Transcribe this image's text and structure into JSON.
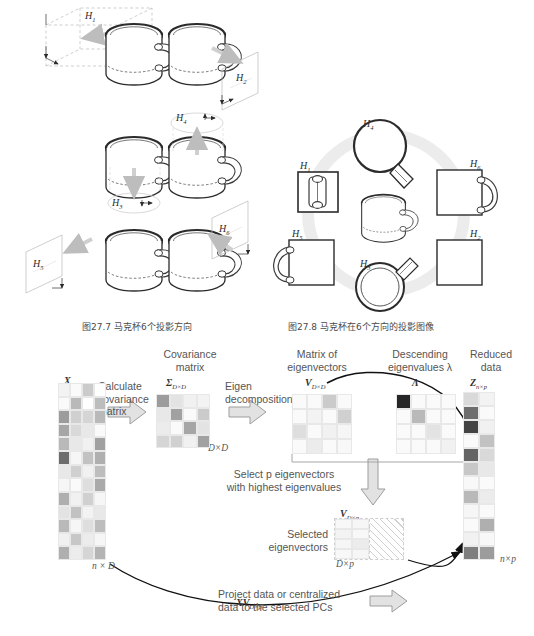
{
  "figure_27_7": {
    "caption": "图27.7   马克杯6个投影方向",
    "plane_labels": [
      "H₁",
      "H₂",
      "H₃",
      "H₄",
      "H₅",
      "H₆"
    ],
    "label_h1": "H",
    "label_h1_sub": "1",
    "label_h2": "H",
    "label_h2_sub": "2",
    "label_h3": "H",
    "label_h3_sub": "3",
    "label_h4": "H",
    "label_h4_sub": "4",
    "label_h5": "H",
    "label_h5_sub": "5",
    "label_h6": "H",
    "label_h6_sub": "6"
  },
  "figure_27_8": {
    "caption": "图27.8   马克杯在6个方向的投影图像",
    "views": [
      {
        "id": "H1",
        "letter": "H",
        "sub": "1",
        "shape": "front-rect-with-handle-silhouette"
      },
      {
        "id": "H4",
        "letter": "H",
        "sub": "4",
        "shape": "circle-top-with-handle"
      },
      {
        "id": "H6",
        "letter": "H",
        "sub": "6",
        "shape": "square-with-right-handle"
      },
      {
        "id": "H5",
        "letter": "H",
        "sub": "5",
        "shape": "square-with-left-handle"
      },
      {
        "id": "H2",
        "letter": "H",
        "sub": "2",
        "shape": "plain-square"
      },
      {
        "id": "H3",
        "letter": "H",
        "sub": "3",
        "shape": "double-circle-with-handle"
      }
    ]
  },
  "pca_diagram": {
    "headings": {
      "covariance_matrix": [
        "Covariance",
        "matrix"
      ],
      "matrix_of_eigenvectors": [
        "Matrix of",
        "eigenvectors"
      ],
      "descending_eigenvalues": [
        "Descending",
        "eigenvalues λ"
      ],
      "reduced_data": [
        "Reduced",
        "data"
      ]
    },
    "matrix_labels": {
      "X": "X",
      "X_sub": "n×D",
      "Sigma": "Σ",
      "Sigma_sub": "D×D",
      "V": "V",
      "V_sub": "D×D",
      "Lambda": "Λ",
      "Z": "Z",
      "Z_sub": "n×p",
      "Vp": "V",
      "Vp_sub": "D×p",
      "XV": "XV",
      "XV_sub": "D×p"
    },
    "dims": {
      "X": "n × D",
      "Sigma": "D×D",
      "Vp": "D×p",
      "Z": "n×p"
    },
    "steps": {
      "calculate_covariance": [
        "Calculate",
        "covariance",
        "matrix"
      ],
      "eigen_decomposition": [
        "Eigen",
        "decomposition"
      ],
      "select_eigenvectors": [
        "Select p eigenvectors",
        "with highest eigenvalues"
      ],
      "selected_eigenvectors": [
        "Selected",
        "eigenvectors"
      ],
      "project_data": [
        "Project data or centralized",
        "data to the selected PCs"
      ]
    },
    "matrix_cells": {
      "X": [
        [
          0.05,
          0.02,
          0.22,
          0.0
        ],
        [
          0.02,
          0.3,
          0.0,
          0.28
        ],
        [
          0.42,
          0.2,
          0.18,
          0.3
        ],
        [
          0.38,
          0.16,
          0.1,
          0.02
        ],
        [
          0.3,
          0.1,
          0.06,
          0.4
        ],
        [
          0.62,
          0.04,
          0.26,
          0.34
        ],
        [
          0.1,
          0.2,
          0.06,
          0.28
        ],
        [
          0.04,
          0.02,
          0.14,
          0.36
        ],
        [
          0.34,
          0.06,
          0.2,
          0.04
        ],
        [
          0.12,
          0.26,
          0.05,
          0.1
        ],
        [
          0.3,
          0.04,
          0.14,
          0.28
        ],
        [
          0.06,
          0.24,
          0.08,
          0.04
        ],
        [
          0.34,
          0.08,
          0.18,
          0.32
        ]
      ],
      "Sigma": [
        [
          0.42,
          0.12,
          0.06,
          0.05
        ],
        [
          0.1,
          0.4,
          0.02,
          0.22
        ],
        [
          0.08,
          0.02,
          0.38,
          0.12
        ],
        [
          0.18,
          0.2,
          0.06,
          0.4
        ]
      ],
      "V": [
        [
          0.02,
          0.02,
          0.22,
          0.02
        ],
        [
          0.02,
          0.05,
          0.02,
          0.2
        ],
        [
          0.14,
          0.02,
          0.06,
          0.04
        ],
        [
          0.02,
          0.08,
          0.02,
          0.03
        ]
      ],
      "Lambda": [
        [
          0.92,
          0.02,
          0.02,
          0.02
        ],
        [
          0.02,
          0.3,
          0.02,
          0.02
        ],
        [
          0.02,
          0.02,
          0.12,
          0.02
        ],
        [
          0.02,
          0.02,
          0.02,
          0.06
        ]
      ],
      "Z": [
        [
          0.16,
          0.05
        ],
        [
          0.62,
          0.02
        ],
        [
          0.8,
          0.06
        ],
        [
          0.02,
          0.26
        ],
        [
          0.66,
          0.16
        ],
        [
          0.24,
          0.1
        ],
        [
          0.03,
          0.02
        ],
        [
          0.3,
          0.08
        ],
        [
          0.04,
          0.02
        ],
        [
          0.02,
          0.34
        ],
        [
          0.06,
          0.03
        ],
        [
          0.55,
          0.42
        ]
      ]
    }
  },
  "colors": {
    "ink": "#2b2b2b",
    "line": "#4a4a4a",
    "arrow_fill": "#d9d9d9",
    "arrow_stroke": "#9a9a9a",
    "grid": "#e8e8e8",
    "halo": "#ececec"
  }
}
